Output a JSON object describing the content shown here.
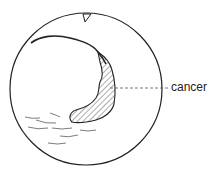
{
  "diagram": {
    "type": "endoscopic-view-illustration",
    "labels": [
      {
        "text": "cancer",
        "target": "hatched-lesion"
      }
    ],
    "colors": {
      "line": "#222222",
      "background": "#ffffff"
    }
  }
}
